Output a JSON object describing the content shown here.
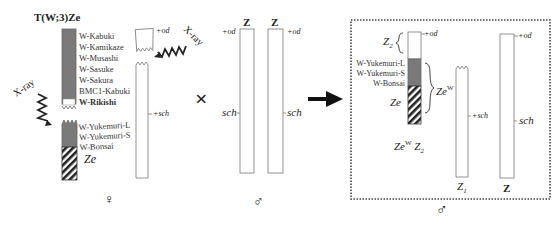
{
  "title": "T(W;3)Ze",
  "female": {
    "symbol": "♀",
    "translocation_labels": [
      "W-Kabuki",
      "W-Kamikaze",
      "W-Musashi",
      "W-Sasuke",
      "W-Sakura",
      "BMC1-Kabuki"
    ],
    "bold_label": "W-Rikishi",
    "fem_label": "Fem",
    "lower_labels": [
      "W-Yukemuri-L",
      "W-Yukemuri-S",
      "W-Bonsai"
    ],
    "ze_label": "Ze",
    "xray_left": "X-ray",
    "xray_right": "X-ray",
    "od_label": "+od",
    "sch_label": "+sch"
  },
  "cross_symbol": "×",
  "male": {
    "symbol": "♂",
    "z_label_1": "Z",
    "z_label_2": "Z",
    "od_label_1": "+od",
    "od_label_2": "+od",
    "sch_label_1": "sch",
    "sch_label_2": "sch"
  },
  "result": {
    "symbol": "♂",
    "z2_label": "Z",
    "z2_sub": "2",
    "labels": [
      "W-Yukemuri-L",
      "W-Yukemuri-S",
      "W-Bonsai"
    ],
    "ze_label": "Ze",
    "zew_label": "Ze",
    "zew_sup": "W",
    "genotype_ze": "Ze",
    "genotype_sup": "W",
    "genotype_z": "Z",
    "genotype_sub": "2",
    "od_label": "+od",
    "sch_label_z1": "+sch",
    "z1_label": "Z",
    "z1_sub": "1",
    "od_label_z": "+od",
    "sch_label_z": "sch",
    "z_label": "Z"
  },
  "colors": {
    "w_segment": "#7a7a7a",
    "line": "#555555",
    "border_dotted": "#444444"
  }
}
